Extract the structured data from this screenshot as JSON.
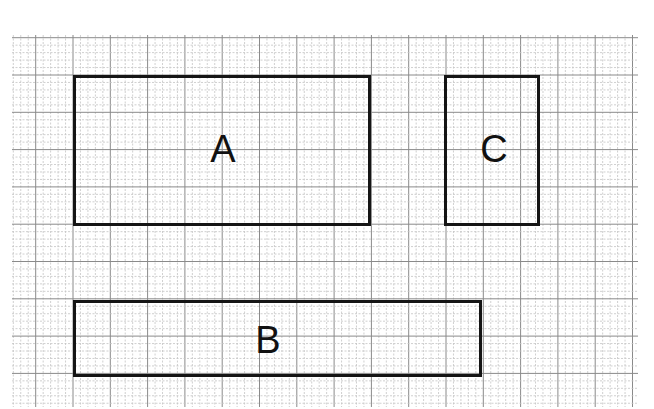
{
  "diagram": {
    "type": "rectangles-on-grid-paper",
    "grid": {
      "left": 12,
      "top": 35,
      "right": 638,
      "bottom": 407,
      "origin_x": 73,
      "origin_y": 75,
      "major_spacing": 37.3,
      "minor_per_major": 5,
      "major_color": "#8a8a8a",
      "minor_color": "#c4c4c4"
    },
    "shapes": [
      {
        "id": "A",
        "label": "A",
        "x": 73,
        "y": 75,
        "w": 298,
        "h": 151,
        "grid_units": "8 x 4"
      },
      {
        "id": "C",
        "label": "C",
        "x": 444,
        "y": 75,
        "w": 96,
        "h": 151,
        "grid_units": "2.5 x 4"
      },
      {
        "id": "B",
        "label": "B",
        "x": 73,
        "y": 300,
        "w": 409,
        "h": 77,
        "grid_units": "11 x 2"
      }
    ],
    "labels": {
      "A": "A",
      "B": "B",
      "C": "C"
    },
    "stroke_color": "#151515"
  }
}
